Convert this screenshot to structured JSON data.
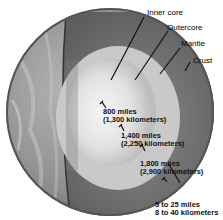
{
  "diagram": {
    "layers": [
      {
        "name": "Inner core",
        "thickness_miles": "800 miles",
        "thickness_km": "(1,300 kilometers)"
      },
      {
        "name": "Outercore",
        "thickness_miles": "1,400 miles",
        "thickness_km": "(2,250 kilometers)"
      },
      {
        "name": "Mantle",
        "thickness_miles": "1,800 miles",
        "thickness_km": "(2,900 kilometers)"
      },
      {
        "name": "Crust",
        "thickness_miles": "5 to 25 miles",
        "thickness_km": "8 to 40 kilometers"
      }
    ],
    "colors": {
      "surface": "#9a9a9a",
      "crust": "#6a6a6a",
      "mantle": "#7b7b7b",
      "outer_core": "#c8c8c8",
      "inner_core": "#efefef"
    }
  }
}
